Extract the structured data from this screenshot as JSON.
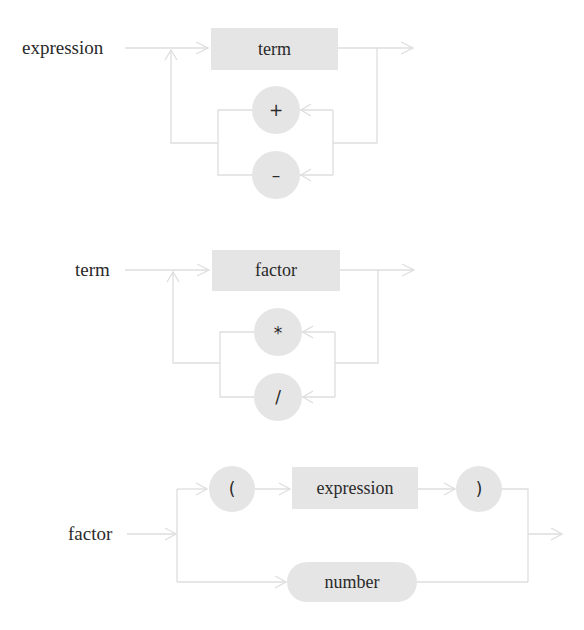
{
  "colors": {
    "background": "#ffffff",
    "node_fill": "#e5e5e5",
    "wire": "#dedede",
    "text": "#2a2a2a"
  },
  "rules": [
    {
      "name": "expression",
      "nonterminal": "term",
      "operators": [
        "+",
        "–"
      ]
    },
    {
      "name": "term",
      "nonterminal": "factor",
      "operators": [
        "*",
        "/"
      ]
    },
    {
      "name": "factor",
      "paren_open": "(",
      "inner": "expression",
      "paren_close": ")",
      "alternative": "number"
    }
  ]
}
